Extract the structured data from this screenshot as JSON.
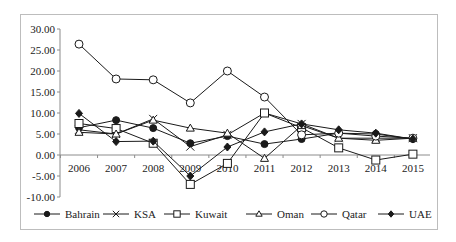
{
  "chart_data": {
    "type": "line",
    "title": "",
    "xlabel": "",
    "ylabel": "",
    "ylim": [
      -10,
      30
    ],
    "yticks": [
      "30.00",
      "25.00",
      "20.00",
      "15.00",
      "10.00",
      "5.00",
      "0.00",
      "-5.00",
      "-10.00"
    ],
    "grid": false,
    "legend_position": "bottom",
    "x": [
      "2006",
      "2007",
      "2008",
      "2009",
      "2010",
      "2011",
      "2012",
      "2013",
      "2014",
      "2015"
    ],
    "series": [
      {
        "name": "Bahrain",
        "marker": "filled-circle",
        "values": [
          6.5,
          8.3,
          6.4,
          2.8,
          4.5,
          2.6,
          3.8,
          5.2,
          5.0,
          3.8
        ]
      },
      {
        "name": "KSA",
        "marker": "x",
        "values": [
          6.0,
          5.0,
          8.6,
          2.0,
          4.8,
          10.0,
          7.4,
          4.0,
          4.0,
          4.0
        ]
      },
      {
        "name": "Kuwait",
        "marker": "open-square",
        "values": [
          7.5,
          6.3,
          2.8,
          -7.0,
          -2.0,
          10.0,
          6.5,
          1.7,
          -1.2,
          0.2
        ]
      },
      {
        "name": "Oman",
        "marker": "open-triangle",
        "values": [
          5.4,
          5.0,
          8.3,
          6.4,
          5.2,
          -0.8,
          7.0,
          4.0,
          3.5,
          4.0
        ]
      },
      {
        "name": "Qatar",
        "marker": "open-circle",
        "values": [
          26.4,
          18.1,
          17.9,
          12.4,
          20.0,
          13.8,
          4.8,
          5.2,
          4.5,
          4.0
        ]
      },
      {
        "name": "UAE",
        "marker": "filled-diamond",
        "values": [
          9.9,
          3.2,
          3.3,
          -5.0,
          1.9,
          5.5,
          7.4,
          6.0,
          5.2,
          3.8
        ]
      }
    ]
  },
  "legend": {
    "items": [
      {
        "label": "Bahrain"
      },
      {
        "label": "KSA"
      },
      {
        "label": "Kuwait"
      },
      {
        "label": "Oman"
      },
      {
        "label": "Qatar"
      },
      {
        "label": "UAE"
      }
    ]
  },
  "colors": {
    "line": "#1a1a1a",
    "frame": "#bdbdbd",
    "axis": "#8c8c8c"
  }
}
